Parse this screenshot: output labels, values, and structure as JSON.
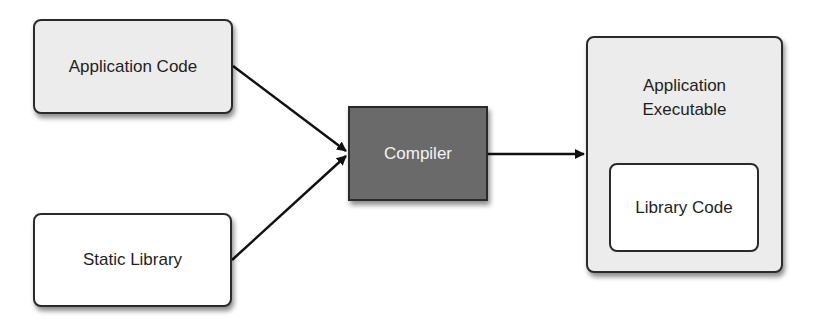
{
  "diagram": {
    "nodes": {
      "application_code": {
        "label": "Application Code"
      },
      "static_library": {
        "label": "Static Library"
      },
      "compiler": {
        "label": "Compiler"
      },
      "application_executable": {
        "label": "Application\nExecutable"
      },
      "library_code": {
        "label": "Library Code"
      }
    },
    "edges": [
      {
        "from": "Application Code",
        "to": "Compiler"
      },
      {
        "from": "Static Library",
        "to": "Compiler"
      },
      {
        "from": "Compiler",
        "to": "Application Executable"
      }
    ],
    "colors": {
      "light_fill": "#ececec",
      "white_fill": "#ffffff",
      "compiler_fill": "#6a6a6a",
      "stroke": "#2a2a2a"
    }
  }
}
